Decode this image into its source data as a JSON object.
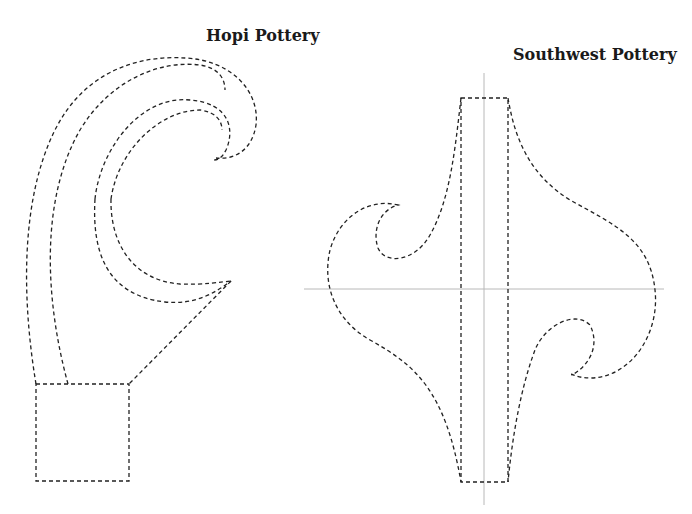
{
  "figures": [
    {
      "title": "Hopi Pottery"
    },
    {
      "title": "Southwest Pottery"
    }
  ]
}
